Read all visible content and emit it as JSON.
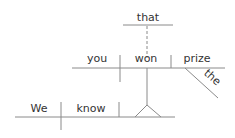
{
  "diagram": {
    "type": "sentence-diagram",
    "sentence": "We know that you won the prize",
    "colors": {
      "line": "#8a8a8a",
      "text": "#333333"
    },
    "main_clause": {
      "subject": "We",
      "verb": "know"
    },
    "noun_clause": {
      "connector": "that",
      "subject": "you",
      "verb": "won",
      "object": "prize",
      "modifier": "the"
    }
  }
}
